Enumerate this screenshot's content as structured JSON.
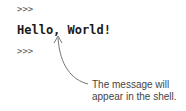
{
  "shell": {
    "prompt_before": ">>>",
    "output": "Hello, World!",
    "prompt_after": ">>>"
  },
  "annotation": {
    "line1": "The message will",
    "line2": "appear in the shell."
  }
}
